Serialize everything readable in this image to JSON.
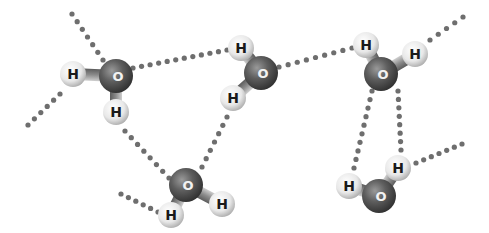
{
  "diagram": {
    "title": "",
    "colors": {
      "background": "#ffffff",
      "oxygen": "#5a5a5a",
      "hydrogen": "#eeeeee",
      "hbond_dots": "#6e6e6e",
      "bond": "#9a9a9a"
    },
    "molecules": [
      {
        "id": "w1",
        "oxygen": {
          "label": "O",
          "x": 116,
          "y": 76
        },
        "hydrogens": [
          {
            "label": "H",
            "x": 73,
            "y": 74
          },
          {
            "label": "H",
            "x": 116,
            "y": 112
          }
        ]
      },
      {
        "id": "w2",
        "oxygen": {
          "label": "O",
          "x": 261,
          "y": 73
        },
        "hydrogens": [
          {
            "label": "H",
            "x": 241,
            "y": 48
          },
          {
            "label": "H",
            "x": 233,
            "y": 98
          }
        ]
      },
      {
        "id": "w3",
        "oxygen": {
          "label": "O",
          "x": 381,
          "y": 74
        },
        "hydrogens": [
          {
            "label": "H",
            "x": 366,
            "y": 45
          },
          {
            "label": "H",
            "x": 415,
            "y": 54
          }
        ]
      },
      {
        "id": "w4",
        "oxygen": {
          "label": "O",
          "x": 186,
          "y": 185
        },
        "hydrogens": [
          {
            "label": "H",
            "x": 171,
            "y": 215
          },
          {
            "label": "H",
            "x": 222,
            "y": 204
          }
        ]
      },
      {
        "id": "w5",
        "oxygen": {
          "label": "O",
          "x": 379,
          "y": 196
        },
        "hydrogens": [
          {
            "label": "H",
            "x": 349,
            "y": 186
          },
          {
            "label": "H",
            "x": 398,
            "y": 168
          }
        ]
      }
    ],
    "hydrogen_bonds": [
      {
        "from": [
          72,
          14
        ],
        "to": [
          103,
          60
        ]
      },
      {
        "from": [
          28,
          125
        ],
        "to": [
          60,
          94
        ]
      },
      {
        "from": [
          133,
          68
        ],
        "to": [
          227,
          50
        ]
      },
      {
        "from": [
          279,
          67
        ],
        "to": [
          352,
          48
        ]
      },
      {
        "from": [
          430,
          40
        ],
        "to": [
          463,
          17
        ]
      },
      {
        "from": [
          125,
          131
        ],
        "to": [
          169,
          178
        ]
      },
      {
        "from": [
          227,
          117
        ],
        "to": [
          202,
          167
        ]
      },
      {
        "from": [
          121,
          194
        ],
        "to": [
          158,
          212
        ]
      },
      {
        "from": [
          372,
          91
        ],
        "to": [
          354,
          168
        ]
      },
      {
        "from": [
          398,
          91
        ],
        "to": [
          401,
          150
        ]
      },
      {
        "from": [
          416,
          163
        ],
        "to": [
          462,
          144
        ]
      }
    ]
  }
}
